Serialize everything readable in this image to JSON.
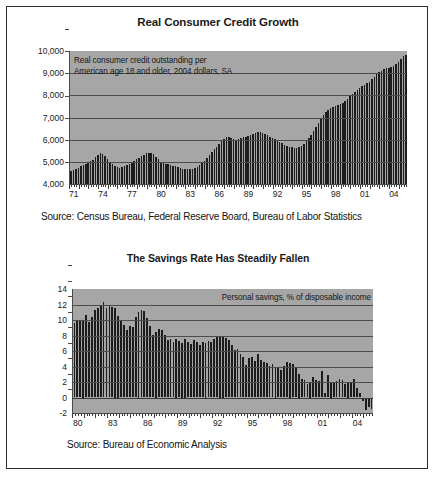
{
  "document": {
    "background_color": "#ffffff",
    "border_color": "#2b2b2b",
    "plot_background_color": "#a6a6a6",
    "bar_color": "#1c1c1c"
  },
  "chart_data": [
    {
      "type": "bar",
      "id": "real-consumer-credit-growth",
      "title": "Real Consumer Credit Growth",
      "annotation": "Real consumer credit outstanding per\nAmerican age 18 and older, 2004 dollars, SA",
      "source": "Source: Census Bureau, Federal Reserve Board, Bureau of Labor Statistics",
      "xlabel": "",
      "ylabel": "",
      "ylim": [
        4000,
        10000
      ],
      "yticks": [
        4000,
        5000,
        6000,
        7000,
        8000,
        9000,
        10000
      ],
      "ytick_labels": [
        "4,000",
        "5,000",
        "6,000",
        "7,000",
        "8,000",
        "9,000",
        "10,000"
      ],
      "grid": true,
      "legend": "none",
      "x_start_year": 1971,
      "x_end_year": 2005,
      "x_per_year": 4,
      "xtick_labels": [
        "71",
        "74",
        "77",
        "80",
        "83",
        "86",
        "89",
        "92",
        "95",
        "98",
        "01",
        "04"
      ],
      "xtick_years": [
        1971,
        1974,
        1977,
        1980,
        1983,
        1986,
        1989,
        1992,
        1995,
        1998,
        2001,
        2004
      ],
      "values": [
        4600,
        4650,
        4690,
        4730,
        4790,
        4850,
        4900,
        4960,
        5020,
        5100,
        5200,
        5300,
        5380,
        5340,
        5260,
        5150,
        5000,
        4880,
        4800,
        4760,
        4740,
        4760,
        4800,
        4860,
        4920,
        4990,
        5060,
        5120,
        5190,
        5260,
        5320,
        5380,
        5420,
        5400,
        5340,
        5240,
        5120,
        5010,
        4940,
        4900,
        4880,
        4860,
        4830,
        4800,
        4760,
        4720,
        4690,
        4670,
        4660,
        4660,
        4670,
        4700,
        4760,
        4840,
        4940,
        5060,
        5180,
        5300,
        5430,
        5560,
        5690,
        5810,
        5930,
        6040,
        6120,
        6130,
        6080,
        6020,
        6000,
        6020,
        6060,
        6100,
        6130,
        6170,
        6210,
        6260,
        6300,
        6330,
        6330,
        6300,
        6250,
        6190,
        6130,
        6070,
        6010,
        5950,
        5890,
        5830,
        5780,
        5730,
        5690,
        5660,
        5640,
        5640,
        5660,
        5720,
        5810,
        5930,
        6070,
        6230,
        6400,
        6580,
        6760,
        6940,
        7100,
        7240,
        7350,
        7430,
        7490,
        7530,
        7560,
        7600,
        7660,
        7740,
        7840,
        7950,
        8060,
        8160,
        8250,
        8330,
        8400,
        8470,
        8540,
        8620,
        8720,
        8830,
        8940,
        9040,
        9120,
        9180,
        9220,
        9250,
        9280,
        9320,
        9400,
        9520,
        9650,
        9780,
        9830
      ]
    },
    {
      "type": "bar",
      "id": "savings-rate-has-steadily-fallen",
      "title": "The Savings Rate Has Steadily Fallen",
      "annotation": "Personal savings, % of disposable income",
      "source": "Source: Bureau of Economic Analysis",
      "xlabel": "",
      "ylabel": "",
      "ylim": [
        -2,
        14
      ],
      "yticks": [
        -2,
        0,
        2,
        4,
        6,
        8,
        10,
        12,
        14
      ],
      "ytick_labels": [
        "-2",
        "0",
        "2",
        "4",
        "6",
        "8",
        "10",
        "12",
        "14"
      ],
      "grid": true,
      "legend": "none",
      "x_start_year": 1980,
      "x_end_year": 2006,
      "x_per_year": 4,
      "xtick_labels": [
        "80",
        "83",
        "86",
        "89",
        "92",
        "95",
        "98",
        "01",
        "04"
      ],
      "xtick_years": [
        1980,
        1983,
        1986,
        1989,
        1992,
        1995,
        1998,
        2001,
        2004
      ],
      "values": [
        9.6,
        9.9,
        9.9,
        10.0,
        10.6,
        9.8,
        10.4,
        11.3,
        11.6,
        11.9,
        12.3,
        11.6,
        11.9,
        11.7,
        11.5,
        10.5,
        9.9,
        9.3,
        8.7,
        9.2,
        9.1,
        10.4,
        11.0,
        11.3,
        11.1,
        10.2,
        9.2,
        8.1,
        8.5,
        8.9,
        8.7,
        8.1,
        7.4,
        7.6,
        7.2,
        7.5,
        7.3,
        7.0,
        7.5,
        7.1,
        6.9,
        7.4,
        7.1,
        6.8,
        7.2,
        7.0,
        7.3,
        7.1,
        7.6,
        7.8,
        8.0,
        8.0,
        7.7,
        7.4,
        6.8,
        6.1,
        6.3,
        5.6,
        5.2,
        4.2,
        5.1,
        5.2,
        4.7,
        5.6,
        4.8,
        4.6,
        4.4,
        4.1,
        4.3,
        4.0,
        3.8,
        3.6,
        4.1,
        4.6,
        4.5,
        4.3,
        3.8,
        3.0,
        2.4,
        2.3,
        1.7,
        2.0,
        2.6,
        2.2,
        2.1,
        3.4,
        0.6,
        2.9,
        2.0,
        1.9,
        2.1,
        2.4,
        2.2,
        1.8,
        2.0,
        1.9,
        2.4,
        1.2,
        0.6,
        -0.4,
        -1.6,
        -1.2,
        -1.5
      ]
    }
  ]
}
